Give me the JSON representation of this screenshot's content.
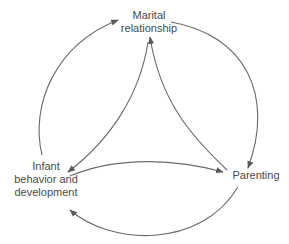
{
  "diagram": {
    "type": "triadic-influence-cycle",
    "stroke_color": "#6a6a6a",
    "text_color": "#4a4a4a",
    "nodes": [
      {
        "id": "marital",
        "line1": "Marital",
        "line2": "relationship",
        "line3": ""
      },
      {
        "id": "infant",
        "line1": "Infant",
        "line2": "behavior and",
        "line3": "development"
      },
      {
        "id": "parenting",
        "line1": "Parenting",
        "line2": "",
        "line3": ""
      }
    ],
    "edges": [
      {
        "from": "infant",
        "to": "marital",
        "style": "outer-arc"
      },
      {
        "from": "marital",
        "to": "parenting",
        "style": "outer-arc"
      },
      {
        "from": "parenting",
        "to": "infant",
        "style": "outer-arc"
      },
      {
        "from": "marital",
        "to": "infant",
        "style": "inner-curve"
      },
      {
        "from": "parenting",
        "to": "marital",
        "style": "inner-curve"
      },
      {
        "from": "infant",
        "to": "parenting",
        "style": "inner-curve"
      }
    ]
  }
}
